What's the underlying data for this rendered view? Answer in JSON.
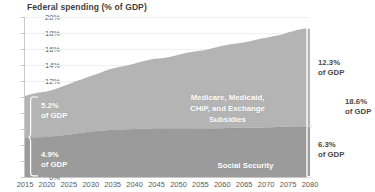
{
  "chart": {
    "title": "Federal spending (% of GDP)"
  },
  "chart_data": {
    "type": "area",
    "title": "Federal spending (% of GDP)",
    "xlabel": "",
    "ylabel": "Federal spending (% of GDP)",
    "xlim": [
      2015,
      2080
    ],
    "ylim": [
      0,
      20
    ],
    "grid": true,
    "legend_position": "in-plot labels",
    "ytick_labels": [
      "0%",
      "2%",
      "4%",
      "6%",
      "8%",
      "10%",
      "12%",
      "14%",
      "16%",
      "18%",
      "20%"
    ],
    "ytick_values": [
      0,
      2,
      4,
      6,
      8,
      10,
      12,
      14,
      16,
      18,
      20
    ],
    "xtick_labels": [
      "2015",
      "2020",
      "2025",
      "2030",
      "2035",
      "2040",
      "2045",
      "2050",
      "2055",
      "2060",
      "2065",
      "2070",
      "2075",
      "2080"
    ],
    "xtick_values": [
      2015,
      2020,
      2025,
      2030,
      2035,
      2040,
      2045,
      2050,
      2055,
      2060,
      2065,
      2070,
      2075,
      2080
    ],
    "x": [
      2015,
      2020,
      2025,
      2030,
      2035,
      2040,
      2045,
      2050,
      2055,
      2060,
      2065,
      2070,
      2075,
      2080
    ],
    "series": [
      {
        "name": "Social Security",
        "color": "#9b9b9b",
        "values": [
          4.9,
          5.0,
          5.3,
          5.7,
          5.9,
          6.0,
          6.1,
          6.1,
          6.1,
          6.1,
          6.2,
          6.2,
          6.3,
          6.3
        ]
      },
      {
        "name": "Medicare, Medicaid, CHIP, and Exchange Subsidies",
        "color": "#b4b4b4",
        "values": [
          5.2,
          5.7,
          6.3,
          7.0,
          7.6,
          8.2,
          8.7,
          9.2,
          9.7,
          10.2,
          10.7,
          11.2,
          11.8,
          12.3
        ]
      }
    ],
    "stacked_totals": [
      10.1,
      10.7,
      11.6,
      12.7,
      13.5,
      14.2,
      14.8,
      15.3,
      15.8,
      16.3,
      16.9,
      17.4,
      18.1,
      18.6
    ],
    "annotations": [
      {
        "id": "health-2015",
        "text": "5.2%\nof GDP",
        "value": 5.2,
        "unit": "% of GDP",
        "series": "Medicare, Medicaid, CHIP, and Exchange Subsidies",
        "year": 2015,
        "side": "left"
      },
      {
        "id": "ss-2015",
        "text": "4.9%\nof GDP",
        "value": 4.9,
        "unit": "% of GDP",
        "series": "Social Security",
        "year": 2015,
        "side": "left"
      },
      {
        "id": "health-2080",
        "text": "12.3%\nof GDP",
        "value": 12.3,
        "unit": "% of GDP",
        "series": "Medicare, Medicaid, CHIP, and Exchange Subsidies",
        "year": 2080,
        "side": "right"
      },
      {
        "id": "ss-2080",
        "text": "6.3%\nof GDP",
        "value": 6.3,
        "unit": "% of GDP",
        "series": "Social Security",
        "year": 2080,
        "side": "right"
      },
      {
        "id": "total-2080",
        "text": "18.6%\nof GDP",
        "value": 18.6,
        "unit": "% of GDP",
        "series": "Total",
        "year": 2080,
        "side": "right-outer"
      }
    ]
  },
  "labels": {
    "series_health_line1": "Medicare, Medicaid,",
    "series_health_line2": "CHIP, and Exchange",
    "series_health_line3": "Subsidies",
    "series_social_security": "Social Security",
    "health_left_pct": "5.2%",
    "health_left_unit": "of GDP",
    "ss_left_pct": "4.9%",
    "ss_left_unit": "of GDP",
    "health_right_pct": "12.3%",
    "health_right_unit": "of GDP",
    "ss_right_pct": "6.3%",
    "ss_right_unit": "of GDP",
    "total_right_pct": "18.6%",
    "total_right_unit": "of GDP"
  },
  "colors": {
    "social_security": "#9b9b9b",
    "health": "#b4b4b4",
    "axis": "#c8c8c8",
    "grid": "#f0f0f0",
    "title_text": "#3f3f3f",
    "tick_text": "#5a5a5a",
    "callout_outer_text": "#4a4a4a",
    "callout_inner_text": "#ffffff"
  }
}
